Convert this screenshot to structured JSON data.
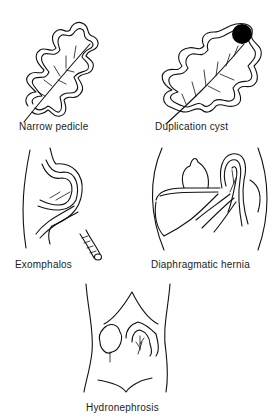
{
  "figure": {
    "panels": [
      {
        "id": "narrow-pedicle",
        "label": "Narrow pedicle"
      },
      {
        "id": "duplication-cyst",
        "label": "Duplication cyst"
      },
      {
        "id": "exomphalos",
        "label": "Exomphalos"
      },
      {
        "id": "diaphragmatic-hernia",
        "label": "Diaphragmatic hernia"
      },
      {
        "id": "hydronephrosis",
        "label": "Hydronephrosis"
      }
    ],
    "colors": {
      "line": "#111111",
      "background": "#ffffff",
      "cyst_fill": "#000000"
    }
  }
}
